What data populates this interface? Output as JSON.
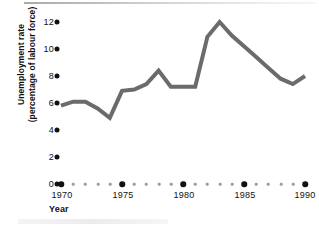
{
  "chart_data": {
    "type": "line",
    "title": "",
    "subtitle": "",
    "xlabel": "Year",
    "ylabel": "Unemployment rate (percentage of labour force)",
    "ylabel_lines": [
      "Unemployment rate",
      "(percentage of labour force)"
    ],
    "xlim": [
      1970,
      1990
    ],
    "ylim": [
      0,
      12.8
    ],
    "grid": false,
    "legend": null,
    "y_ticks": [
      0,
      2,
      4,
      6,
      8,
      10,
      12
    ],
    "y_tick_labels": [
      "0",
      "2",
      "4",
      "6",
      "8",
      "10",
      "12"
    ],
    "x_ticks": [
      1970,
      1975,
      1980,
      1985,
      1990
    ],
    "x_tick_labels": [
      "1970",
      "1975",
      "1980",
      "1985",
      "1990"
    ],
    "x_minor_ticks": [
      1971,
      1972,
      1973,
      1974,
      1976,
      1977,
      1978,
      1979,
      1981,
      1982,
      1983,
      1984,
      1986,
      1987,
      1988,
      1989
    ],
    "series": [
      {
        "name": "Unemployment rate",
        "color": "#6b6b6b",
        "line_width": 4,
        "x": [
          1970,
          1971,
          1972,
          1973,
          1974,
          1975,
          1976,
          1977,
          1978,
          1979,
          1980,
          1981,
          1982,
          1983,
          1984,
          1985,
          1986,
          1987,
          1988,
          1989,
          1990
        ],
        "values": [
          5.8,
          6.1,
          6.1,
          5.6,
          4.9,
          6.9,
          7.0,
          7.4,
          8.4,
          7.2,
          7.2,
          7.2,
          10.9,
          12.0,
          11.0,
          10.2,
          9.4,
          8.6,
          7.8,
          7.4,
          8.0
        ]
      }
    ],
    "annotations": [],
    "colors": {
      "line": "#6b6b6b",
      "tick_major": "#111111",
      "tick_minor": "#9b9b9b",
      "text": "#101010",
      "background": "#ffffff"
    }
  },
  "axis": {
    "y_title_line1": "Unemployment rate",
    "y_title_line2": "(percentage of labour force)",
    "x_title": "Year"
  }
}
